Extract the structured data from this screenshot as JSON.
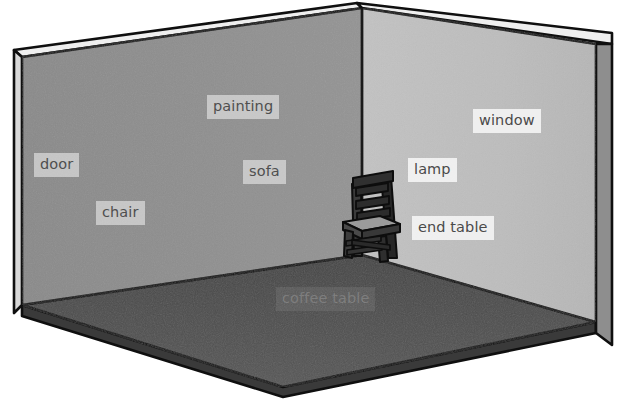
{
  "scene": {
    "title": "room-perspective-diagram",
    "description": "Isometric cutaway drawing of an empty room corner with two walls, a floor, and a single wooden ladder-back chair. Furniture name labels float over the walls and floor.",
    "colors": {
      "background": "#ffffff",
      "left_wall": "#8d8d8d",
      "left_wall_edge": "#7b7b7b",
      "right_wall": "#bebebe",
      "right_wall_edge": "#a9a9a9",
      "floor": "#4e4e4e",
      "floor_front_edge": "#5d5d5d",
      "outline": "#111111",
      "chair_dark": "#2b2b2b",
      "chair_seat": "#9a9a9a",
      "chair_mid": "#555555",
      "label_bg_light": "#e9e9e9",
      "label_text": "#4f4f4f"
    }
  },
  "labels": [
    {
      "id": "painting",
      "text": "painting",
      "surface": "left-wall",
      "x": 207,
      "y": 95
    },
    {
      "id": "door",
      "text": "door",
      "surface": "left-wall",
      "x": 34,
      "y": 153
    },
    {
      "id": "sofa",
      "text": "sofa",
      "surface": "left-wall",
      "x": 243,
      "y": 160
    },
    {
      "id": "chair",
      "text": "chair",
      "surface": "left-wall",
      "x": 96,
      "y": 201
    },
    {
      "id": "window",
      "text": "window",
      "surface": "right-wall",
      "x": 473,
      "y": 109
    },
    {
      "id": "lamp",
      "text": "lamp",
      "surface": "right-wall",
      "x": 408,
      "y": 158
    },
    {
      "id": "end-table",
      "text": "end table",
      "surface": "right-wall",
      "x": 412,
      "y": 216
    },
    {
      "id": "coffee-table",
      "text": "coffee table",
      "surface": "floor",
      "x": 276,
      "y": 287
    }
  ],
  "objects": [
    {
      "id": "chair-object",
      "name": "wooden ladder-back chair",
      "x": 339,
      "y": 168,
      "width": 68,
      "height": 96
    }
  ]
}
